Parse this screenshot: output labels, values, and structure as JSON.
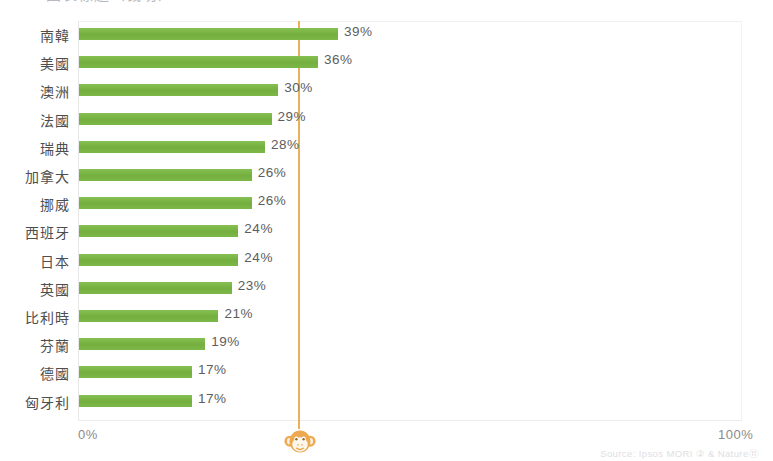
{
  "title": {
    "cropped_text": "圖表標題（裁切）"
  },
  "axis": {
    "min_label": "0%",
    "max_label": "100%"
  },
  "logo": {
    "name": "monkey-logo",
    "color": "#eda94f"
  },
  "source": {
    "text": "Source: Ipsos MORI ② & Nature⑪"
  },
  "colors": {
    "bar": "#7fba4c",
    "reference_line": "#e8a33d",
    "label": "#4e4e4e",
    "value": "#5d5d5d",
    "axis": "#8b8b8b"
  },
  "chart_data": {
    "type": "bar",
    "orientation": "horizontal",
    "title": "",
    "xlabel": "",
    "ylabel": "",
    "xlim": [
      0,
      100
    ],
    "grid": false,
    "legend": null,
    "unit": "%",
    "categories": [
      "南韓",
      "美國",
      "澳洲",
      "法國",
      "瑞典",
      "加拿大",
      "挪威",
      "西班牙",
      "日本",
      "英國",
      "比利時",
      "芬蘭",
      "德國",
      "匈牙利"
    ],
    "values": [
      39,
      36,
      30,
      29,
      28,
      26,
      26,
      24,
      24,
      23,
      21,
      19,
      17,
      17
    ],
    "value_labels": [
      "39%",
      "36%",
      "30%",
      "29%",
      "28%",
      "26%",
      "26%",
      "24%",
      "24%",
      "23%",
      "21%",
      "19%",
      "17%",
      "17%"
    ],
    "annotations": [
      {
        "type": "vline",
        "value": 33,
        "color": "#e8a33d",
        "label": ""
      }
    ]
  }
}
